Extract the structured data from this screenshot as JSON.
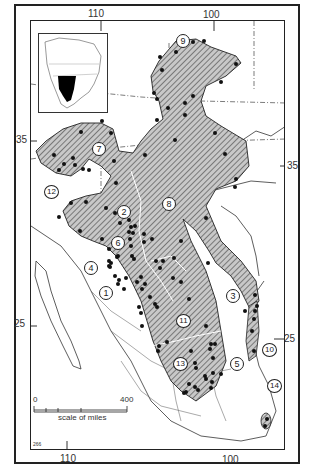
{
  "map": {
    "longitude_labels_top": [
      "110",
      "100"
    ],
    "longitude_labels_bottom": [
      "110",
      "100"
    ],
    "latitude_labels_left": [
      "35",
      "25"
    ],
    "latitude_labels_right": [
      "35",
      "25"
    ],
    "region_numbers": [
      "1",
      "2",
      "3",
      "4",
      "5",
      "6",
      "7",
      "8",
      "9",
      "10",
      "11",
      "12",
      "13",
      "14"
    ],
    "scale": {
      "start": "0",
      "end": "400",
      "unit_label": "scale of miles"
    },
    "figure_code": "266",
    "inset": {
      "description": "North America locator map with range shaded black"
    },
    "colors": {
      "range_fill": "#8a8a8a",
      "hatch": "#333333",
      "dot": "#111111",
      "outline": "#222222"
    }
  }
}
